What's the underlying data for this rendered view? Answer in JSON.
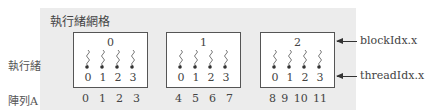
{
  "title": "執行緒網格",
  "labels": {
    "threads": "執行緒",
    "array": "陣列A"
  },
  "blocks": [
    {
      "block_idx": "0",
      "thread_idx": [
        "0",
        "1",
        "2",
        "3"
      ],
      "array": [
        "0",
        "1",
        "2",
        "3"
      ]
    },
    {
      "block_idx": "1",
      "thread_idx": [
        "0",
        "1",
        "2",
        "3"
      ],
      "array": [
        "4",
        "5",
        "6",
        "7"
      ]
    },
    {
      "block_idx": "2",
      "thread_idx": [
        "0",
        "1",
        "2",
        "3"
      ],
      "array": [
        "8",
        "9",
        "10",
        "11"
      ]
    }
  ],
  "annotations": {
    "block": "blockIdx.x",
    "thread": "threadIdx.x"
  },
  "colors": {
    "panel": "#ececec",
    "border": "#555555"
  }
}
